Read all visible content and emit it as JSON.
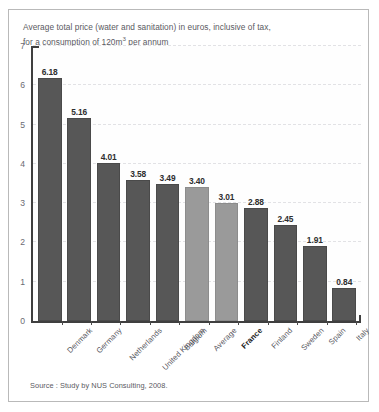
{
  "figure": {
    "title_line1": "Average total price (water and sanitation) in euros, inclusive of tax,",
    "title_line2_pre": "for a consumption of 120m",
    "title_line2_sup": "3",
    "title_line2_post": " per annum",
    "source": "Source : Study by NUS Consulting, 2008.",
    "colors": {
      "bar_dark": "#575757",
      "bar_light": "#9a9a9a",
      "axis": "#3f3f3f",
      "grid": "#e2e2e5",
      "frame": "#b9b9b9",
      "text": "#55555c",
      "value_text": "#2e2e2e"
    }
  },
  "chart_data": {
    "type": "bar",
    "title": "Average total price (water and sanitation) in euros, inclusive of tax, for a consumption of 120m3 per annum",
    "xlabel": "",
    "ylabel": "",
    "ylim": [
      0,
      7
    ],
    "yticks": [
      0,
      1,
      2,
      3,
      4,
      5,
      6,
      7
    ],
    "ytick_labels": [
      "0",
      "1",
      "2",
      "3",
      "4",
      "5",
      "6",
      "7"
    ],
    "grid": true,
    "legend": "none",
    "categories": [
      "Denmark",
      "Germany",
      "Netherlands",
      "United Kingdom",
      "Belgium",
      "Average",
      "France",
      "Finland",
      "Sweden",
      "Spain",
      "Italy"
    ],
    "values": [
      6.18,
      5.16,
      4.01,
      3.58,
      3.49,
      3.4,
      3.01,
      2.88,
      2.45,
      1.91,
      0.84
    ],
    "value_labels": [
      "6.18",
      "5.16",
      "4.01",
      "3.58",
      "3.49",
      "3.40",
      "3.01",
      "2.88",
      "2.45",
      "1.91",
      "0.84"
    ],
    "bar_styles": [
      "dark",
      "dark",
      "dark",
      "dark",
      "dark",
      "light",
      "light",
      "dark",
      "dark",
      "dark",
      "dark"
    ],
    "highlight_labels": [
      "France"
    ],
    "source": "Source : Study by NUS Consulting, 2008."
  }
}
